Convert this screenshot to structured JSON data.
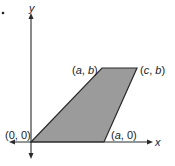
{
  "diagram": {
    "type": "coordinate-plane-trapezoid",
    "colors": {
      "fill": "#9b9b9b",
      "stroke": "#2a2a2a",
      "axis": "#2a2a2a"
    },
    "axes": {
      "x_label": "x",
      "y_label": "y"
    },
    "vertices": [
      {
        "label": "(0, 0)",
        "pre": "(",
        "v1": "0",
        "sep": ", ",
        "v2": "0",
        "post": ")"
      },
      {
        "label": "(a, b)",
        "pre": "(",
        "v1": "a",
        "sep": ", ",
        "v2": "b",
        "post": ")"
      },
      {
        "label": "(c, b)",
        "pre": "(",
        "v1": "c",
        "sep": ", ",
        "v2": "b",
        "post": ")"
      },
      {
        "label": "(a, 0)",
        "pre": "(",
        "v1": "a",
        "sep": ", ",
        "v2": "0",
        "post": ")"
      }
    ],
    "marker": "•"
  }
}
